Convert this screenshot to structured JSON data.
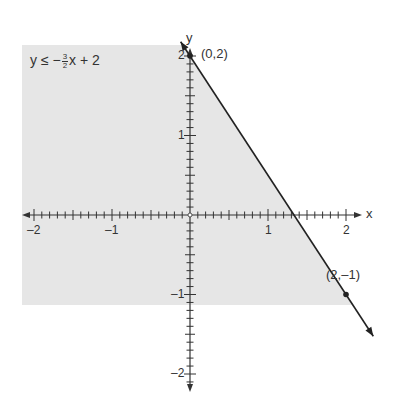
{
  "chart_data": {
    "type": "line",
    "title": "",
    "inequality": {
      "lhs": "y",
      "op": "≤",
      "sign": "−",
      "frac_num": "3",
      "frac_den": "2",
      "rest": "x + 2",
      "full": "y ≤ −3/2x + 2"
    },
    "line": {
      "slope": -1.5,
      "intercept": 2,
      "style": "solid"
    },
    "shaded_region": "below line (y ≤ −3/2x + 2)",
    "points": [
      {
        "x": 0,
        "y": 2,
        "label": "(0,2)"
      },
      {
        "x": 2,
        "y": -1,
        "label": "(2,–1)"
      }
    ],
    "xlabel": "x",
    "ylabel": "y",
    "xlim": [
      -2.2,
      2.2
    ],
    "ylim": [
      -2.1,
      2.2
    ],
    "x_ticks": [
      -2,
      -1,
      1,
      2
    ],
    "x_tick_labels": [
      "–2",
      "–1",
      "1",
      "2"
    ],
    "y_ticks": [
      -2,
      -1,
      1,
      2
    ],
    "y_tick_labels": [
      "–2",
      "–1",
      "1",
      "2"
    ],
    "minor_ticks_per_unit": 10,
    "grid": false,
    "colors": {
      "shade": "#e6e6e6",
      "line": "#222222",
      "axis": "#333333",
      "text": "#333333"
    }
  }
}
